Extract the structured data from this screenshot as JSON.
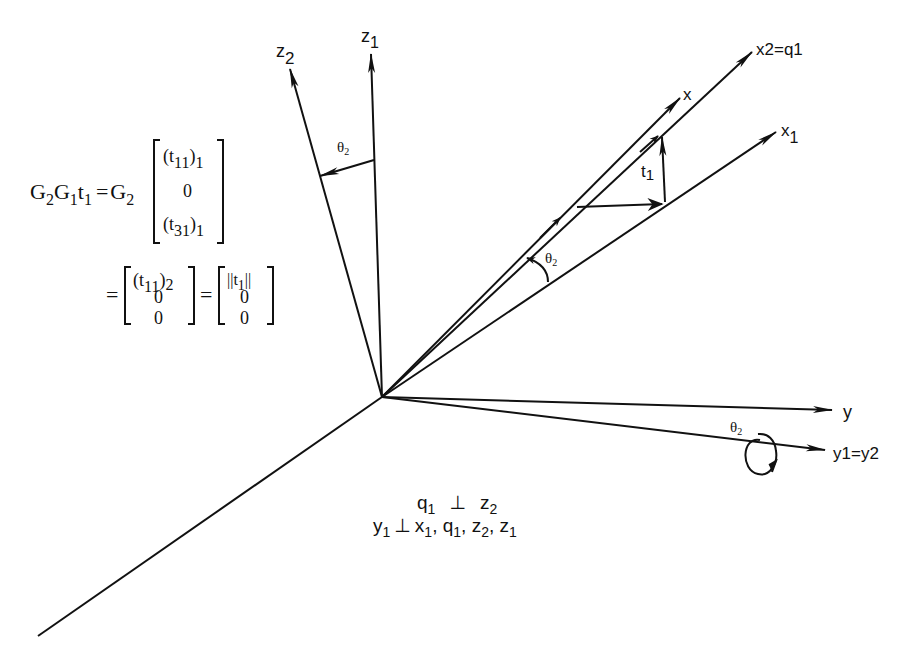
{
  "figure": {
    "axes": {
      "z1": {
        "label": "z",
        "sub": "1"
      },
      "z2": {
        "label": "z",
        "sub": "2"
      },
      "x": {
        "label": "x"
      },
      "x1": {
        "label": "x",
        "sub": "1"
      },
      "x2_q1": {
        "label": "x2=q1"
      },
      "y": {
        "label": "y"
      },
      "y1_y2": {
        "label": "y1=y2"
      },
      "t1": {
        "label": "t",
        "sub": "1"
      }
    },
    "angles": {
      "theta2_z": {
        "label": "θ",
        "sub": "2"
      },
      "theta2_x": {
        "label": "θ",
        "sub": "2"
      },
      "theta2_y": {
        "label": "θ",
        "sub": "2"
      }
    },
    "equations": {
      "line1_lhs": [
        "G",
        "2",
        "G",
        "1",
        "t",
        "1"
      ],
      "line1_eq": "=",
      "line1_g": [
        "G",
        "2"
      ],
      "matrix1": [
        "(t11)1",
        "0",
        "(t31)1"
      ],
      "matrix1_parts": {
        "r1": {
          "base": "(t",
          "sub1": "11",
          "close": ")",
          "sub2": "1"
        },
        "r2": "0",
        "r3": {
          "base": "(t",
          "sub1": "31",
          "close": ")",
          "sub2": "1"
        }
      },
      "line2_eq": "=",
      "matrix2_parts": {
        "r1": {
          "base": "(t",
          "sub1": "11",
          "close": ")",
          "sub2": "2"
        },
        "r2": "0",
        "r3": "0"
      },
      "line2_eq2": "=",
      "matrix3_parts": {
        "r1": {
          "pre": "||t",
          "sub": "1",
          "post": "||"
        },
        "r2": "0",
        "r3": "0"
      }
    },
    "caption": {
      "line1": {
        "a": "q",
        "a_sub": "1",
        "op": "⊥",
        "b": "z",
        "b_sub": "2"
      },
      "line2": {
        "a": "y",
        "a_sub": "1",
        "op": "⊥",
        "items": [
          {
            "v": "x",
            "s": "1"
          },
          {
            "v": "q",
            "s": "1"
          },
          {
            "v": "z",
            "s": "2"
          },
          {
            "v": "z",
            "s": "1"
          }
        ]
      }
    }
  }
}
